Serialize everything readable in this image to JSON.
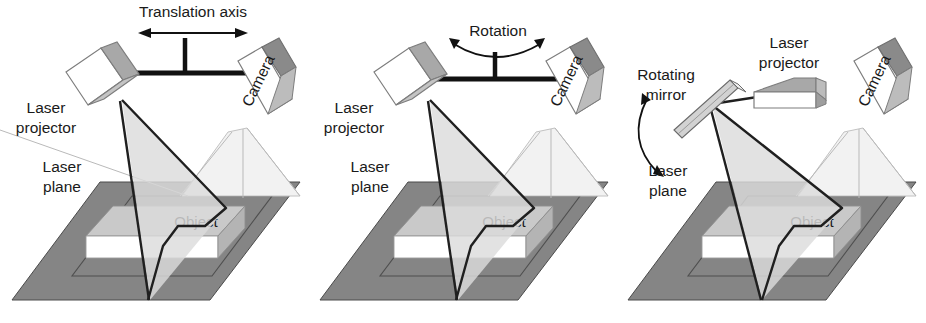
{
  "figure": {
    "panel_count": 3
  },
  "colors": {
    "ground": "#858585",
    "ground_edge": "#4a4a4a",
    "inner_quad_edge": "#4f4f4f",
    "laser_plane_fill": "#dcdcdc",
    "laser_plane_edge": "#1f1f1f",
    "object_top": "#c9c9c9",
    "object_front": "#ffffff",
    "object_side": "#b4b4b4",
    "box_front": "#ffffff",
    "box_gray": "#a8a8a8",
    "box_dark": "#8a8a8a",
    "bar_black": "#111111",
    "camera_ray": "#b9b9b9",
    "text": "#1a1a1a",
    "mirror_body": "#d2d2d2"
  },
  "panels": [
    {
      "id": "panel-1",
      "motion_label": "Translation axis",
      "motion_type": "translation",
      "labels": {
        "laser_projector": [
          "Laser",
          "projector"
        ],
        "laser_plane": [
          "Laser",
          "plane"
        ],
        "camera": "Camera",
        "object": "Object"
      },
      "has_mount_bar": true,
      "has_mirror": false
    },
    {
      "id": "panel-2",
      "motion_label": "Rotation",
      "motion_type": "rotation",
      "labels": {
        "laser_projector": [
          "Laser",
          "projector"
        ],
        "laser_plane": [
          "Laser",
          "plane"
        ],
        "camera": "Camera",
        "object": "Object"
      },
      "has_mount_bar": true,
      "has_mirror": false
    },
    {
      "id": "panel-3",
      "motion_label": "Rotating mirror",
      "motion_type": "mirror-rotation",
      "labels": {
        "laser_projector": [
          "Laser",
          "projector"
        ],
        "laser_plane": [
          "Laser",
          "plane"
        ],
        "camera": "Camera",
        "object": "Object",
        "rotating_mirror": [
          "Rotating",
          "mirror"
        ]
      },
      "has_mount_bar": false,
      "has_mirror": true
    }
  ]
}
